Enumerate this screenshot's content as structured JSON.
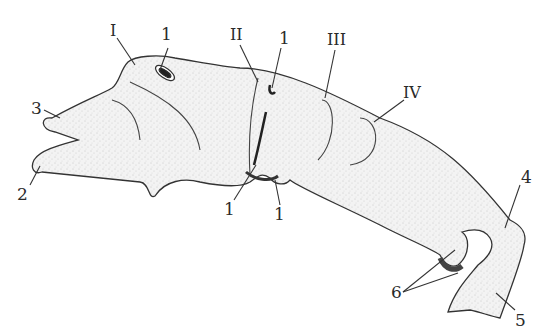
{
  "figure": {
    "roman_labels": [
      {
        "id": "I",
        "text": "I",
        "x": 128,
        "y": 38
      },
      {
        "id": "II",
        "text": "II",
        "x": 250,
        "y": 36
      },
      {
        "id": "III",
        "text": "III",
        "x": 330,
        "y": 43
      },
      {
        "id": "IV",
        "text": "IV",
        "x": 408,
        "y": 100
      }
    ],
    "number_labels": [
      {
        "id": "1a",
        "text": "1",
        "x": 163,
        "y": 38
      },
      {
        "id": "1b",
        "text": "1",
        "x": 279,
        "y": 42
      },
      {
        "id": "1c",
        "text": "1",
        "x": 224,
        "y": 213
      },
      {
        "id": "1d",
        "text": "1",
        "x": 275,
        "y": 218
      },
      {
        "id": "2",
        "text": "2",
        "x": 17,
        "y": 200
      },
      {
        "id": "3",
        "text": "3",
        "x": 33,
        "y": 112
      },
      {
        "id": "4",
        "text": "4",
        "x": 524,
        "y": 180
      },
      {
        "id": "5",
        "text": "5",
        "x": 516,
        "y": 319
      },
      {
        "id": "6",
        "text": "6",
        "x": 392,
        "y": 298
      }
    ]
  }
}
